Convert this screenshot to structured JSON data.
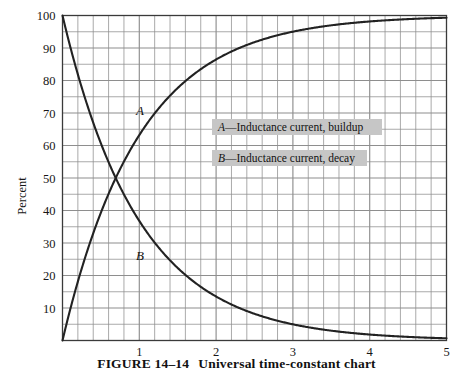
{
  "figure": {
    "caption_prefix": "FIGURE 14–14",
    "caption_title": "Universal time-constant chart"
  },
  "axes": {
    "ylabel": "Percent",
    "xlabel": "",
    "y_ticks": [
      10,
      20,
      30,
      40,
      50,
      60,
      70,
      80,
      90,
      100
    ],
    "x_ticks": [
      1,
      2,
      3,
      4,
      5
    ],
    "xlim": [
      0,
      5
    ],
    "ylim": [
      0,
      100
    ],
    "y_minor_step": 5,
    "x_minor_step": 0.2,
    "grid": true,
    "grid_color": "#8e8e8e",
    "frame_color": "#3a3a3a"
  },
  "curves": {
    "a_tag": "A",
    "b_tag": "B",
    "curve_color": "#222222"
  },
  "legend": {
    "position": "inside-right-upper",
    "background": "#c6c6c6",
    "entries": [
      {
        "key": "A",
        "dash": "—",
        "label": "Inductance current, buildup"
      },
      {
        "key": "B",
        "dash": "—",
        "label": "Inductance current, decay"
      }
    ]
  },
  "chart_data": {
    "type": "line",
    "title": "Universal time-constant chart",
    "xlabel": "",
    "ylabel": "Percent",
    "xlim": [
      0,
      5
    ],
    "ylim": [
      0,
      100
    ],
    "grid": true,
    "legend_position": "inside-right-upper",
    "x": [
      0,
      0.1,
      0.2,
      0.3,
      0.4,
      0.5,
      0.6,
      0.7,
      0.8,
      0.9,
      1.0,
      1.2,
      1.4,
      1.6,
      1.8,
      2.0,
      2.2,
      2.4,
      2.6,
      2.8,
      3.0,
      3.2,
      3.4,
      3.6,
      3.8,
      4.0,
      4.2,
      4.4,
      4.6,
      4.8,
      5.0
    ],
    "series": [
      {
        "name": "A",
        "label": "A—Inductance current, buildup",
        "formula": "100*(1-exp(-t))",
        "values": [
          0,
          9.5,
          18.1,
          25.9,
          33.0,
          39.3,
          45.1,
          50.3,
          55.1,
          59.3,
          63.2,
          69.9,
          75.3,
          79.8,
          83.5,
          86.5,
          88.9,
          90.9,
          92.6,
          93.9,
          95.0,
          95.9,
          96.7,
          97.3,
          97.8,
          98.2,
          98.5,
          98.8,
          99.0,
          99.2,
          99.3
        ]
      },
      {
        "name": "B",
        "label": "B—Inductance current, decay",
        "formula": "100*exp(-t)",
        "values": [
          100,
          90.5,
          81.9,
          74.1,
          67.0,
          60.7,
          54.9,
          49.7,
          44.9,
          40.7,
          36.8,
          30.1,
          24.7,
          20.2,
          16.5,
          13.5,
          11.1,
          9.1,
          7.4,
          6.1,
          5.0,
          4.1,
          3.3,
          2.7,
          2.2,
          1.8,
          1.5,
          1.2,
          1.0,
          0.8,
          0.7
        ]
      }
    ],
    "annotations": [
      {
        "text": "A",
        "x": 1.0,
        "y": 72
      },
      {
        "text": "B",
        "x": 1.0,
        "y": 30
      }
    ]
  }
}
